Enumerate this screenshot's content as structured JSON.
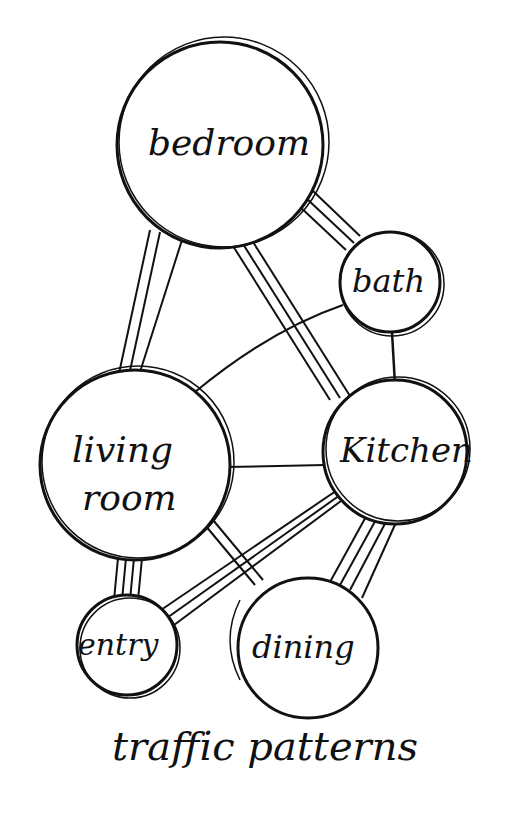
{
  "diagram": {
    "title": "traffic patterns",
    "colors": {
      "ink": "#111111",
      "paper": "#ffffff"
    },
    "nodes": [
      {
        "id": "bedroom",
        "label": "bedroom",
        "cx": 220,
        "cy": 145,
        "r": 105
      },
      {
        "id": "bath",
        "label": "bath",
        "cx": 390,
        "cy": 282,
        "r": 50
      },
      {
        "id": "living",
        "label": "living room",
        "label_lines": [
          "living",
          "room"
        ],
        "cx": 135,
        "cy": 465,
        "r": 95
      },
      {
        "id": "kitchen",
        "label": "Kitchen",
        "cx": 395,
        "cy": 450,
        "r": 70
      },
      {
        "id": "entry",
        "label": "entry",
        "cx": 127,
        "cy": 645,
        "r": 50
      },
      {
        "id": "dining",
        "label": "dining",
        "cx": 305,
        "cy": 645,
        "r": 70
      }
    ],
    "edges": [
      {
        "from": "bedroom",
        "to": "living",
        "strokes": 3
      },
      {
        "from": "bedroom",
        "to": "kitchen",
        "strokes": 3
      },
      {
        "from": "bedroom",
        "to": "bath",
        "strokes": 3
      },
      {
        "from": "bath",
        "to": "kitchen",
        "strokes": 1
      },
      {
        "from": "bath",
        "to": "living",
        "strokes": 1
      },
      {
        "from": "living",
        "to": "kitchen",
        "strokes": 1
      },
      {
        "from": "living",
        "to": "entry",
        "strokes": 4
      },
      {
        "from": "living",
        "to": "dining",
        "strokes": 2
      },
      {
        "from": "kitchen",
        "to": "entry",
        "strokes": 3
      },
      {
        "from": "kitchen",
        "to": "dining",
        "strokes": 4
      }
    ]
  }
}
